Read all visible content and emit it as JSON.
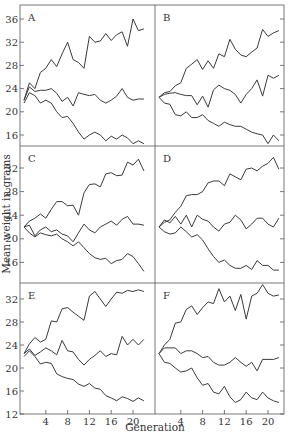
{
  "chart_data": {
    "type": "line",
    "title": "",
    "ylabel": "Mean weight in grams",
    "xlabel": "Generation",
    "layout": "3 rows x 2 columns of panels, shared axes",
    "x_ticks": [
      4,
      8,
      12,
      16,
      20
    ],
    "x_range": [
      0,
      22
    ],
    "grid": false,
    "legend": null,
    "y_ticks_by_row": [
      [
        16,
        20,
        24,
        28,
        32,
        36
      ],
      [
        16,
        20,
        24,
        28,
        32
      ],
      [
        12,
        16,
        20,
        24,
        28,
        32
      ]
    ],
    "y_range_by_row": [
      [
        13.7,
        38.3
      ],
      [
        13.5,
        36.5
      ],
      [
        12,
        35
      ]
    ],
    "panels": [
      {
        "label": "A",
        "row": 0,
        "col": 0,
        "series": [
          {
            "name": "selection up",
            "x": [
              0,
              1,
              2,
              3,
              4,
              5,
              6,
              7,
              8,
              9,
              10,
              11,
              12,
              13,
              14,
              15,
              16,
              17,
              18,
              19,
              20,
              21,
              22
            ],
            "values": [
              22,
              25,
              24,
              26.8,
              27.5,
              29,
              27.8,
              30,
              32,
              29,
              28.5,
              27.5,
              33,
              32,
              32.2,
              33.5,
              32.3,
              33.3,
              33.8,
              31.3,
              36,
              34,
              34.3
            ]
          },
          {
            "name": "control",
            "x": [
              0,
              1,
              2,
              3,
              4,
              5,
              6,
              7,
              8,
              9,
              10,
              11,
              12,
              13,
              14,
              15,
              16,
              17,
              18,
              19,
              20,
              21,
              22
            ],
            "values": [
              22,
              24.3,
              23.5,
              23.7,
              23.7,
              24,
              23.2,
              21.8,
              22.5,
              21,
              23.3,
              23,
              22.8,
              23,
              22,
              21.5,
              22,
              22.7,
              24,
              22.5,
              22,
              22.2,
              22.2
            ]
          },
          {
            "name": "selection down",
            "x": [
              0,
              1,
              2,
              3,
              4,
              5,
              6,
              7,
              8,
              9,
              10,
              11,
              12,
              13,
              14,
              15,
              16,
              17,
              18,
              19,
              20,
              21,
              22
            ],
            "values": [
              21.5,
              23.3,
              22.8,
              21.5,
              22,
              21.5,
              20,
              19,
              19.2,
              18,
              16.5,
              15.3,
              16,
              16.5,
              16,
              15,
              15.8,
              15.3,
              16,
              15.5,
              14.5,
              15,
              14.5
            ]
          }
        ]
      },
      {
        "label": "B",
        "row": 0,
        "col": 1,
        "series": [
          {
            "name": "selection up",
            "x": [
              0,
              1,
              2,
              3,
              4,
              5,
              6,
              7,
              8,
              9,
              10,
              11,
              12,
              13,
              14,
              15,
              16,
              17,
              18,
              19,
              20,
              21,
              22
            ],
            "values": [
              22.5,
              23.3,
              23.5,
              24.5,
              25,
              27.5,
              28.2,
              29,
              27.3,
              28.8,
              27.5,
              30,
              29.5,
              32.5,
              30.8,
              29.8,
              29.5,
              30.3,
              31,
              34.2,
              33,
              33.6,
              34
            ]
          },
          {
            "name": "control",
            "x": [
              0,
              1,
              2,
              3,
              4,
              5,
              6,
              7,
              8,
              9,
              10,
              11,
              12,
              13,
              14,
              15,
              16,
              17,
              18,
              19,
              20,
              21,
              22
            ],
            "values": [
              22.5,
              23,
              23.2,
              23.3,
              23,
              22.8,
              22.8,
              21.2,
              22.7,
              20.8,
              23.8,
              24.6,
              24,
              23.7,
              23,
              21.5,
              23,
              24,
              25.5,
              22.7,
              26.3,
              25.8,
              26.3
            ]
          },
          {
            "name": "selection down",
            "x": [
              0,
              1,
              2,
              3,
              4,
              5,
              6,
              7,
              8,
              9,
              10,
              11,
              12,
              13,
              14,
              15,
              16,
              17,
              18,
              19,
              20,
              21,
              22
            ],
            "values": [
              22.5,
              21.5,
              21.3,
              19.5,
              19.3,
              20,
              19,
              19,
              19.5,
              18.5,
              18,
              17.5,
              18.2,
              17.8,
              17.5,
              17.5,
              17,
              16.5,
              16.2,
              16,
              14.5,
              16,
              15
            ]
          }
        ]
      },
      {
        "label": "C",
        "row": 1,
        "col": 0,
        "series": [
          {
            "name": "selection up",
            "x": [
              0,
              1,
              2,
              3,
              4,
              5,
              6,
              7,
              8,
              9,
              10,
              11,
              12,
              13,
              14,
              15,
              16,
              17,
              18,
              19,
              20,
              21,
              22
            ],
            "values": [
              22,
              23,
              23.5,
              24.2,
              23.5,
              25,
              26.3,
              26.3,
              25.6,
              25.7,
              24,
              27.8,
              29.2,
              29.3,
              28.8,
              31,
              31.2,
              30.7,
              30.8,
              33,
              32.5,
              33.5,
              31.5
            ]
          },
          {
            "name": "control",
            "x": [
              0,
              1,
              2,
              3,
              4,
              5,
              6,
              7,
              8,
              9,
              10,
              11,
              12,
              13,
              14,
              15,
              16,
              17,
              18,
              19,
              20,
              21,
              22
            ],
            "values": [
              22,
              22.3,
              20.5,
              21.5,
              22,
              21.2,
              21.5,
              20.8,
              20.5,
              19.5,
              21,
              22.5,
              21.5,
              21,
              22,
              22.5,
              23,
              22.3,
              23.3,
              23.8,
              22.5,
              22.5,
              22.3
            ]
          },
          {
            "name": "selection down",
            "x": [
              0,
              1,
              2,
              3,
              4,
              5,
              6,
              7,
              8,
              9,
              10,
              11,
              12,
              13,
              14,
              15,
              16,
              17,
              18,
              19,
              20,
              21,
              22
            ],
            "values": [
              22,
              21,
              20.3,
              21,
              20.7,
              20.5,
              20.8,
              20,
              19.5,
              18.8,
              19.5,
              18.5,
              17.5,
              16.8,
              16.5,
              16.7,
              15.8,
              16.3,
              16.5,
              17.5,
              17,
              15.8,
              14.5
            ]
          }
        ]
      },
      {
        "label": "D",
        "row": 1,
        "col": 1,
        "series": [
          {
            "name": "selection up",
            "x": [
              0,
              1,
              2,
              3,
              4,
              5,
              6,
              7,
              8,
              9,
              10,
              11,
              12,
              13,
              14,
              15,
              16,
              17,
              18,
              19,
              20,
              21,
              22
            ],
            "values": [
              22,
              22.8,
              23.2,
              24.5,
              25.5,
              27.3,
              27.5,
              27.5,
              28,
              29.5,
              29.8,
              29.8,
              29,
              31,
              30.5,
              30,
              31.8,
              32,
              31.5,
              32.3,
              32.8,
              33.8,
              31.8
            ]
          },
          {
            "name": "control",
            "x": [
              0,
              1,
              2,
              3,
              4,
              5,
              6,
              7,
              8,
              9,
              10,
              11,
              12,
              13,
              14,
              15,
              16,
              17,
              18,
              19,
              20,
              21,
              22
            ],
            "values": [
              22,
              23.2,
              22.7,
              23.8,
              22.5,
              24,
              22,
              24,
              23.3,
              23,
              22,
              21.3,
              22.5,
              22.8,
              24,
              23.2,
              21.7,
              22.5,
              23.5,
              23.5,
              22.5,
              22,
              23.5
            ]
          },
          {
            "name": "selection down",
            "x": [
              0,
              1,
              2,
              3,
              4,
              5,
              6,
              7,
              8,
              9,
              10,
              11,
              12,
              13,
              14,
              15,
              16,
              17,
              18,
              19,
              20,
              21,
              22
            ],
            "values": [
              22,
              21.2,
              20.8,
              21,
              22,
              21.2,
              20.3,
              20.7,
              19.8,
              18.3,
              17,
              16,
              16.4,
              15.5,
              15,
              15,
              15.5,
              14.8,
              16.3,
              15.5,
              15.5,
              14.7,
              14.7
            ]
          }
        ]
      },
      {
        "label": "E",
        "row": 2,
        "col": 0,
        "series": [
          {
            "name": "selection up",
            "x": [
              0,
              1,
              2,
              3,
              4,
              5,
              6,
              7,
              8,
              9,
              10,
              11,
              12,
              13,
              14,
              15,
              16,
              17,
              18,
              19,
              20,
              21,
              22
            ],
            "values": [
              22.5,
              24.2,
              25.3,
              24.5,
              25,
              28.2,
              28,
              30.3,
              30.5,
              29.7,
              29,
              28.3,
              32.5,
              33.3,
              32,
              30.7,
              32,
              33.2,
              33,
              33.5,
              33.3,
              33.6,
              33.3
            ]
          },
          {
            "name": "control",
            "x": [
              0,
              1,
              2,
              3,
              4,
              5,
              6,
              7,
              8,
              9,
              10,
              11,
              12,
              13,
              14,
              15,
              16,
              17,
              18,
              19,
              20,
              21,
              22
            ],
            "values": [
              22.5,
              23.3,
              22.2,
              22.8,
              23.5,
              23,
              22.3,
              24.8,
              23,
              22.8,
              21.5,
              20.5,
              21.5,
              22.2,
              23,
              22,
              22.5,
              22.3,
              25.5,
              24,
              25,
              24,
              25
            ]
          },
          {
            "name": "selection down",
            "x": [
              0,
              1,
              2,
              3,
              4,
              5,
              6,
              7,
              8,
              9,
              10,
              11,
              12,
              13,
              14,
              15,
              16,
              17,
              18,
              19,
              20,
              21,
              22
            ],
            "values": [
              22,
              23,
              22,
              20.7,
              21,
              20.8,
              19,
              18.5,
              18.2,
              18,
              17.2,
              16.8,
              17.3,
              16.5,
              16.3,
              15.2,
              14.8,
              14.3,
              15,
              14.7,
              14.2,
              14.8,
              14.3
            ]
          }
        ]
      },
      {
        "label": "F",
        "row": 2,
        "col": 1,
        "series": [
          {
            "name": "selection up",
            "x": [
              0,
              1,
              2,
              3,
              4,
              5,
              6,
              7,
              8,
              9,
              10,
              11,
              12,
              13,
              14,
              15,
              16,
              17,
              18,
              19,
              20,
              21,
              22
            ],
            "values": [
              22.5,
              24,
              25,
              27.8,
              28,
              30.2,
              30.8,
              29.3,
              30.5,
              31.5,
              31.2,
              33.8,
              31.5,
              32.5,
              30,
              32.8,
              28.5,
              32.5,
              33,
              34.5,
              33,
              32.5,
              32.7
            ]
          },
          {
            "name": "control",
            "x": [
              0,
              1,
              2,
              3,
              4,
              5,
              6,
              7,
              8,
              9,
              10,
              11,
              12,
              13,
              14,
              15,
              16,
              17,
              18,
              19,
              20,
              21,
              22
            ],
            "values": [
              22.5,
              23.5,
              23.5,
              23.5,
              22.5,
              23,
              23,
              22.5,
              21.8,
              22,
              21,
              20.5,
              20.5,
              21,
              21.8,
              21,
              20.3,
              21,
              19.5,
              21.5,
              21.5,
              21.5,
              21.8
            ]
          },
          {
            "name": "selection down",
            "x": [
              0,
              1,
              2,
              3,
              4,
              5,
              6,
              7,
              8,
              9,
              10,
              11,
              12,
              13,
              14,
              15,
              16,
              17,
              18,
              19,
              20,
              21,
              22
            ],
            "values": [
              22.5,
              21,
              20.8,
              20,
              19.3,
              19.5,
              20,
              18.3,
              17,
              17.3,
              15.8,
              15.5,
              16.8,
              15,
              14,
              14.5,
              15.8,
              14.8,
              14.5,
              15.8,
              14.8,
              14.3,
              14
            ]
          }
        ]
      }
    ]
  }
}
